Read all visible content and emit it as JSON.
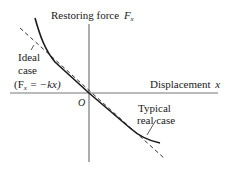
{
  "figure": {
    "y_axis_label": "Restoring force",
    "y_axis_symbol": "F",
    "y_axis_subscript": "x",
    "x_axis_label": "Displacement",
    "x_axis_symbol": "x",
    "origin_label": "O",
    "ideal_label_line1": "Ideal",
    "ideal_label_line2": "case",
    "ideal_equation": "(F",
    "ideal_equation_sub": "x",
    "ideal_equation_rest": " = −kx)",
    "typical_label_line1": "Typical",
    "typical_label_line2": "real case"
  },
  "colors": {
    "axis": "#777777",
    "curve": "#1a1a1a",
    "text": "#1a1a1a"
  }
}
